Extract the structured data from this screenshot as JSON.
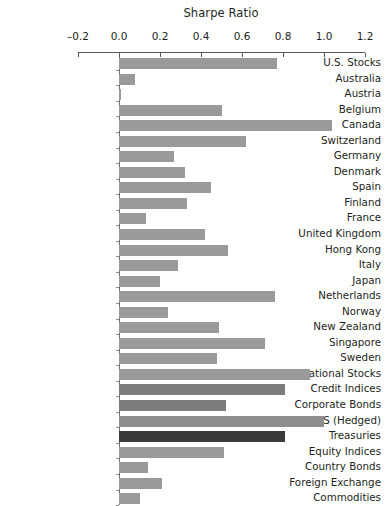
{
  "chart_data": {
    "type": "bar",
    "orientation": "horizontal",
    "title": "Sharpe Ratio",
    "xlabel": "",
    "ylabel": "",
    "xlim": [
      -0.2,
      1.2
    ],
    "xticks": [
      -0.2,
      0.0,
      0.2,
      0.4,
      0.6,
      0.8,
      1.0,
      1.2
    ],
    "xtick_labels": [
      "–0.2",
      "0.0",
      "0.2",
      "0.4",
      "0.6",
      "0.8",
      "1.0",
      "1.2"
    ],
    "grid": false,
    "legend": null,
    "categories": [
      "U.S. Stocks",
      "Australia",
      "Austria",
      "Belgium",
      "Canada",
      "Switzerland",
      "Germany",
      "Denmark",
      "Spain",
      "Finland",
      "France",
      "United Kingdom",
      "Hong Kong",
      "Italy",
      "Japan",
      "Netherlands",
      "Norway",
      "New Zealand",
      "Singapore",
      "Sweden",
      "International Stocks",
      "Credit Indices",
      "Corporate Bonds",
      "CDS (Hedged)",
      "Treasuries",
      "Equity Indices",
      "Country Bonds",
      "Foreign Exchange",
      "Commodities"
    ],
    "values": [
      0.77,
      0.08,
      0.01,
      0.5,
      1.04,
      0.62,
      0.27,
      0.32,
      0.45,
      0.33,
      0.13,
      0.42,
      0.53,
      0.29,
      0.2,
      0.76,
      0.24,
      0.49,
      0.71,
      0.48,
      0.93,
      0.81,
      0.52,
      1.0,
      0.81,
      0.51,
      0.14,
      0.21,
      0.1
    ],
    "bar_colors": [
      "#9a9a9a",
      "#9a9a9a",
      "#9a9a9a",
      "#9a9a9a",
      "#9a9a9a",
      "#9a9a9a",
      "#9a9a9a",
      "#9a9a9a",
      "#9a9a9a",
      "#9a9a9a",
      "#9a9a9a",
      "#9a9a9a",
      "#9a9a9a",
      "#9a9a9a",
      "#9a9a9a",
      "#9a9a9a",
      "#9a9a9a",
      "#9a9a9a",
      "#9a9a9a",
      "#9a9a9a",
      "#9a9a9a",
      "#7c7c7c",
      "#7c7c7c",
      "#8e8e8e",
      "#3b3b3b",
      "#9a9a9a",
      "#9a9a9a",
      "#9a9a9a",
      "#9a9a9a"
    ]
  },
  "colors": {
    "axis": "#58585a",
    "text": "#231f20",
    "background": "#ffffff",
    "bar_default": "#9a9a9a",
    "bar_dark": "#3b3b3b"
  }
}
